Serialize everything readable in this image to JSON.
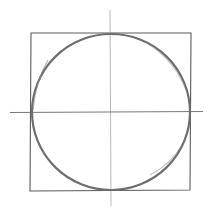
{
  "diagram": {
    "title": "Circle inscribed in a square with center axes",
    "shapes": {
      "square": {
        "x1": 31,
        "y1": 33,
        "x2": 191,
        "y2": 191,
        "stroke": "#5a5a5a",
        "width": 1.1
      },
      "circle": {
        "cx": 111,
        "cy": 112,
        "rx": 79,
        "ry": 78,
        "stroke": "#6e6e6e",
        "width": 2.2
      },
      "horizontal_axis": {
        "x1": 10,
        "y1": 112,
        "x2": 203,
        "y2": 112,
        "stroke": "#6a6a6a",
        "width": 0.9
      },
      "vertical_axis": {
        "x1": 110,
        "y1": 10,
        "x2": 111,
        "y2": 206,
        "stroke": "#9a9a9a",
        "width": 0.7
      }
    }
  }
}
